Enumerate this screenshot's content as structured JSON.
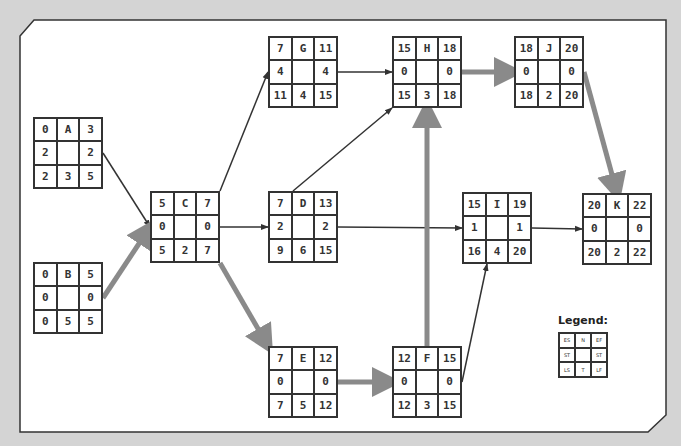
{
  "diagram": {
    "type": "critical-path-network",
    "nodes": [
      {
        "id": "A",
        "ES": 0,
        "EF": 3,
        "ST_left": 2,
        "ST_right": 2,
        "LS": 2,
        "T": 3,
        "LF": 5,
        "x": 33,
        "y": 117
      },
      {
        "id": "B",
        "ES": 0,
        "EF": 5,
        "ST_left": 0,
        "ST_right": 0,
        "LS": 0,
        "T": 5,
        "LF": 5,
        "x": 33,
        "y": 262
      },
      {
        "id": "C",
        "ES": 5,
        "EF": 7,
        "ST_left": 0,
        "ST_right": 0,
        "LS": 5,
        "T": 2,
        "LF": 7,
        "x": 150,
        "y": 191
      },
      {
        "id": "G",
        "ES": 7,
        "EF": 11,
        "ST_left": 4,
        "ST_right": 4,
        "LS": 11,
        "T": 4,
        "LF": 15,
        "x": 268,
        "y": 36
      },
      {
        "id": "D",
        "ES": 7,
        "EF": 13,
        "ST_left": 2,
        "ST_right": 2,
        "LS": 9,
        "T": 6,
        "LF": 15,
        "x": 268,
        "y": 191
      },
      {
        "id": "E",
        "ES": 7,
        "EF": 12,
        "ST_left": 0,
        "ST_right": 0,
        "LS": 7,
        "T": 5,
        "LF": 12,
        "x": 268,
        "y": 346
      },
      {
        "id": "H",
        "ES": 15,
        "EF": 18,
        "ST_left": 0,
        "ST_right": 0,
        "LS": 15,
        "T": 3,
        "LF": 18,
        "x": 392,
        "y": 36
      },
      {
        "id": "F",
        "ES": 12,
        "EF": 15,
        "ST_left": 0,
        "ST_right": 0,
        "LS": 12,
        "T": 3,
        "LF": 15,
        "x": 392,
        "y": 346
      },
      {
        "id": "I",
        "ES": 15,
        "EF": 19,
        "ST_left": 1,
        "ST_right": 1,
        "LS": 16,
        "T": 4,
        "LF": 20,
        "x": 462,
        "y": 192
      },
      {
        "id": "J",
        "ES": 18,
        "EF": 20,
        "ST_left": 0,
        "ST_right": 0,
        "LS": 18,
        "T": 2,
        "LF": 20,
        "x": 514,
        "y": 36
      },
      {
        "id": "K",
        "ES": 20,
        "EF": 22,
        "ST_left": 0,
        "ST_right": 0,
        "LS": 20,
        "T": 2,
        "LF": 22,
        "x": 582,
        "y": 193
      }
    ],
    "edges": [
      {
        "from": "A",
        "to": "C",
        "critical": false
      },
      {
        "from": "B",
        "to": "C",
        "critical": true
      },
      {
        "from": "C",
        "to": "G",
        "critical": false
      },
      {
        "from": "C",
        "to": "D",
        "critical": false
      },
      {
        "from": "C",
        "to": "E",
        "critical": true
      },
      {
        "from": "G",
        "to": "H",
        "critical": false
      },
      {
        "from": "D",
        "to": "H",
        "critical": false
      },
      {
        "from": "D",
        "to": "I",
        "critical": false
      },
      {
        "from": "E",
        "to": "F",
        "critical": true
      },
      {
        "from": "F",
        "to": "H",
        "critical": true
      },
      {
        "from": "F",
        "to": "I",
        "critical": false
      },
      {
        "from": "H",
        "to": "J",
        "critical": true
      },
      {
        "from": "J",
        "to": "K",
        "critical": true
      },
      {
        "from": "I",
        "to": "K",
        "critical": false
      }
    ],
    "colors": {
      "critical": "#8a8a8a",
      "normal": "#333333",
      "panel": "#ffffff",
      "background": "#d4d4d4"
    }
  },
  "legend": {
    "title": "Legend:",
    "cells": [
      "ES",
      "N",
      "EF",
      "ST",
      "",
      "ST",
      "LS",
      "T",
      "LF"
    ]
  }
}
